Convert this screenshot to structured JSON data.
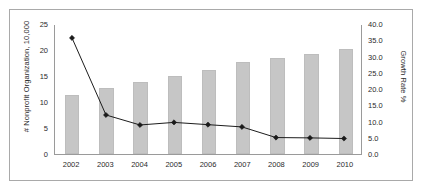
{
  "chart_data": {
    "type": "bar",
    "title": "",
    "categories": [
      "2002",
      "2003",
      "2004",
      "2005",
      "2006",
      "2007",
      "2008",
      "2009",
      "2010"
    ],
    "xlabel": "",
    "ylabel": "# Nonprofit Organization, 10,000",
    "ylabel_secondary": "Growth Rate %",
    "ylim": [
      0,
      25
    ],
    "ylim_secondary": [
      0,
      40
    ],
    "yticks": [
      "0",
      "5",
      "10",
      "15",
      "20",
      "25"
    ],
    "ytick_values": [
      0,
      5,
      10,
      15,
      20,
      25
    ],
    "yticks_secondary": [
      "0.0",
      "5.0",
      "10.0",
      "15.0",
      "20.0",
      "25.0",
      "30.0",
      "35.0",
      "40.0"
    ],
    "ytick_values_secondary": [
      0,
      5,
      10,
      15,
      20,
      25,
      30,
      35,
      40
    ],
    "grid": false,
    "legend": "none",
    "series": [
      {
        "name": "# Nonprofit Organization, 10,000",
        "type": "bar",
        "axis": "left",
        "color": "#c6c6c6",
        "values": [
          11.3,
          12.6,
          13.8,
          15.0,
          16.2,
          17.6,
          18.5,
          19.3,
          20.1
        ]
      },
      {
        "name": "Growth Rate %",
        "type": "line",
        "axis": "right",
        "color": "#1a1a1a",
        "marker": "diamond",
        "values": [
          36.0,
          12.1,
          9.0,
          9.8,
          9.1,
          8.4,
          5.1,
          5.0,
          4.8
        ]
      }
    ]
  },
  "axes": {
    "left_title": "# Nonprofit Organization, 10,000",
    "right_title": "Growth Rate %"
  },
  "colors": {
    "bar": "#c6c6c6",
    "line": "#1a1a1a",
    "border": "#a9a9a9",
    "axis": "#9a9a9a",
    "text": "#2b2b2b"
  }
}
